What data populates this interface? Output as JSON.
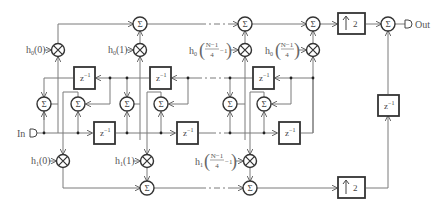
{
  "diagram": {
    "type": "polyphase FIR interpolator signal-flow diagram",
    "input_label": "In",
    "output_label": "Out",
    "sum_symbol": "Σ",
    "delay_label": "z",
    "delay_exponent": "−1",
    "upsampler_label": "2",
    "upsampler_icon": "up-arrow",
    "multiplier_icon": "circle-x",
    "branch_0": {
      "coefficients": [
        {
          "base": "h",
          "sub": "0",
          "arg": "(0)"
        },
        {
          "base": "h",
          "sub": "0",
          "arg": "(1)"
        },
        {
          "base": "h",
          "sub": "0",
          "arg_frac_num": "N−1",
          "arg_frac_den": "4",
          "arg_suffix": "−1"
        },
        {
          "base": "h",
          "sub": "0",
          "arg_frac_num": "N−1",
          "arg_frac_den": "4",
          "arg_suffix": ""
        }
      ]
    },
    "branch_1": {
      "coefficients": [
        {
          "base": "h",
          "sub": "1",
          "arg": "(0)"
        },
        {
          "base": "h",
          "sub": "1",
          "arg": "(1)"
        },
        {
          "base": "h",
          "sub": "1",
          "arg_frac_num": "N−1",
          "arg_frac_den": "4",
          "arg_suffix": "−1"
        }
      ]
    }
  }
}
